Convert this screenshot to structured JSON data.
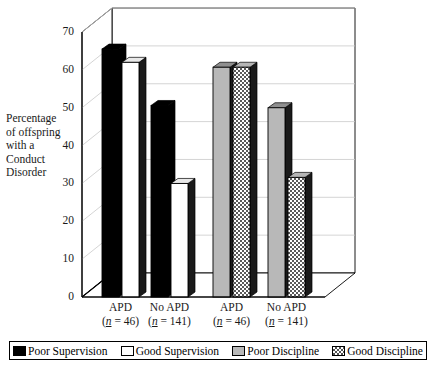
{
  "figure": {
    "y_axis_title_lines": [
      "Percentage",
      "of offspring",
      "with a",
      "Conduct",
      "Disorder"
    ]
  },
  "chart_data": {
    "type": "bar",
    "title": "",
    "xlabel": "",
    "ylabel": "Percentage of offspring with a Conduct Disorder",
    "ylim": [
      0,
      70
    ],
    "yticks": [
      0,
      10,
      20,
      30,
      40,
      50,
      60,
      70
    ],
    "ytick_labels": [
      "0",
      "10",
      "20",
      "30",
      "40",
      "50",
      "60",
      "70"
    ],
    "grid": true,
    "three_d": true,
    "legend_position": "bottom",
    "categories": [
      "APD (n = 46)",
      "No APD (n = 141)",
      "APD (n = 46)",
      "No APD (n = 141)"
    ],
    "category_lines": [
      {
        "line1": "APD",
        "line2_prefix": "(",
        "line2_n": "n",
        "line2_suffix": " = 46)"
      },
      {
        "line1": "No APD",
        "line2_prefix": "(",
        "line2_n": "n",
        "line2_suffix": " = 141)"
      },
      {
        "line1": "APD",
        "line2_prefix": "(",
        "line2_n": "n",
        "line2_suffix": " = 46)"
      },
      {
        "line1": "No APD",
        "line2_prefix": "(",
        "line2_n": "n",
        "line2_suffix": " = 141)"
      }
    ],
    "bars": [
      {
        "label": "Poor Supervision",
        "group": "APD (n = 46)",
        "value": 65.5,
        "fill": "black"
      },
      {
        "label": "Good Supervision",
        "group": "APD (n = 46)",
        "value": 62.0,
        "fill": "white"
      },
      {
        "label": "Poor Supervision",
        "group": "No APD (n = 141)",
        "value": 50.6,
        "fill": "black"
      },
      {
        "label": "Good Supervision",
        "group": "No APD (n = 141)",
        "value": 30.0,
        "fill": "white"
      },
      {
        "label": "Poor Discipline",
        "group": "APD (n = 46)",
        "value": 60.7,
        "fill": "gray"
      },
      {
        "label": "Good Discipline",
        "group": "APD (n = 46)",
        "value": 60.7,
        "fill": "check"
      },
      {
        "label": "Poor Discipline",
        "group": "No APD (n = 141)",
        "value": 50.0,
        "fill": "gray"
      },
      {
        "label": "Good Discipline",
        "group": "No APD (n = 141)",
        "value": 31.6,
        "fill": "check"
      }
    ],
    "legend": [
      {
        "label": "Poor Supervision",
        "fill": "black",
        "swatch_class": "sw-black"
      },
      {
        "label": "Good Supervision",
        "fill": "white",
        "swatch_class": "sw-white"
      },
      {
        "label": "Poor Discipline",
        "fill": "gray",
        "swatch_class": "sw-gray"
      },
      {
        "label": "Good Discipline",
        "fill": "check",
        "swatch_class": "sw-check"
      }
    ]
  },
  "colors": {
    "black": "#000000",
    "white": "#ffffff",
    "gray": "#b8b8b8",
    "axis": "#000000",
    "grid": "#c9c9c9"
  }
}
